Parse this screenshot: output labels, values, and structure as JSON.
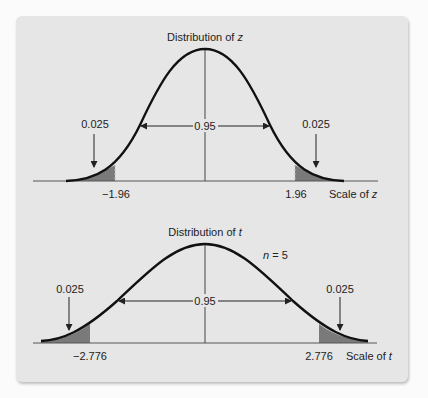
{
  "figure": {
    "top": {
      "title_prefix": "Distribution of ",
      "title_var": "z",
      "center_area": "0.95",
      "left_tail_area": "0.025",
      "right_tail_area": "0.025",
      "left_critical": "−1.96",
      "right_critical": "1.96",
      "scale_prefix": "Scale of ",
      "scale_var": "z"
    },
    "bottom": {
      "title_prefix": "Distribution of ",
      "title_var": "t",
      "df_label_var": "n",
      "df_label_rest": " = 5",
      "center_area": "0.95",
      "left_tail_area": "0.025",
      "right_tail_area": "0.025",
      "left_critical": "−2.776",
      "right_critical": "2.776",
      "scale_prefix": "Scale of ",
      "scale_var": "t"
    },
    "colors": {
      "panel": "#e6e6e6",
      "curve": "#111111",
      "shade": "#7a7a7a",
      "axis": "#555555"
    }
  }
}
